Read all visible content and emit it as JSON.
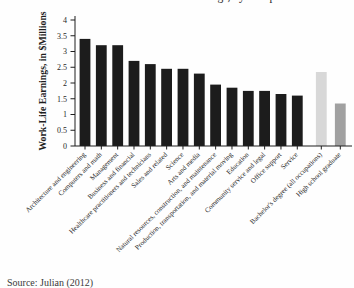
{
  "page": {
    "background": "#fefefe",
    "cropped_title_fragment": "work-life earnings, by occupation",
    "source_note": "Source: Julian (2012)"
  },
  "chart_data": {
    "type": "bar",
    "title": "",
    "xlabel": "",
    "ylabel": "Work-Life Earnings, in $Millions",
    "ylim": [
      0,
      4
    ],
    "yticks": [
      0,
      0.5,
      1,
      1.5,
      2,
      2.5,
      3,
      3.5,
      4
    ],
    "ytick_labels": [
      "0",
      "0.5",
      "1",
      "1.5",
      "2",
      "2.5",
      "3",
      "3.5",
      "4"
    ],
    "grid": false,
    "legend_position": "none",
    "gap_after_category": "Service",
    "categories": [
      "Architecture and engineering",
      "Computers and math",
      "Management",
      "Business and financial",
      "Healthcare practitioners and technicians",
      "Sales and related",
      "Science",
      "Arts and media",
      "Natural resources, construction, and maintenance",
      "Production, transportation, and material moving",
      "Education",
      "Community service and legal",
      "Office support",
      "Service",
      "Bachelor's degree (all occupations)",
      "High school graduate"
    ],
    "values": [
      3.4,
      3.2,
      3.2,
      2.7,
      2.6,
      2.45,
      2.45,
      2.3,
      1.95,
      1.85,
      1.75,
      1.75,
      1.65,
      1.6,
      2.35,
      1.35
    ],
    "bar_colors": [
      "#1c1c1c",
      "#1c1c1c",
      "#1c1c1c",
      "#1c1c1c",
      "#1c1c1c",
      "#1c1c1c",
      "#1c1c1c",
      "#1c1c1c",
      "#1c1c1c",
      "#1c1c1c",
      "#1c1c1c",
      "#1c1c1c",
      "#1c1c1c",
      "#1c1c1c",
      "#d8d8d8",
      "#a1a1a1"
    ],
    "axis_color": "#1e1e1e"
  }
}
